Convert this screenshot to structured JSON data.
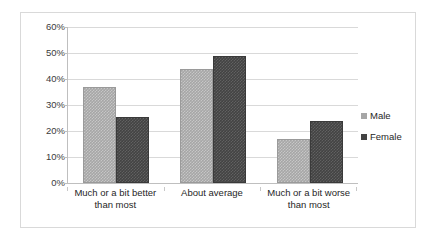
{
  "chart_data": {
    "type": "bar",
    "title": "",
    "subtitle": "",
    "xlabel": "",
    "ylabel": "",
    "ylim": [
      0,
      60
    ],
    "ytick_labels": [
      "0%",
      "10%",
      "20%",
      "30%",
      "40%",
      "50%",
      "60%"
    ],
    "ytick_values": [
      0,
      10,
      20,
      30,
      40,
      50,
      60
    ],
    "grid": true,
    "legend_position": "right",
    "categories": [
      "Much or a bit better than most",
      "About average",
      "Much or a bit worse than most"
    ],
    "category_lines": [
      [
        "Much or a bit better",
        "than most"
      ],
      [
        "About average",
        ""
      ],
      [
        "Much or a bit worse",
        "than most"
      ]
    ],
    "series": [
      {
        "name": "Male",
        "color": "#a6a6a6",
        "values": [
          37,
          44,
          17
        ]
      },
      {
        "name": "Female",
        "color": "#434343",
        "values": [
          25.5,
          49,
          24
        ]
      }
    ]
  },
  "legend": {
    "items": [
      {
        "label": "Male",
        "marker": "square-marker-light"
      },
      {
        "label": "Female",
        "marker": "square-marker-dark"
      }
    ]
  },
  "colors": {
    "male": "#a6a6a6",
    "female": "#434343",
    "gridline": "#d9d9d9",
    "axis": "#bfbfbf",
    "frame": "#d9d9d9",
    "text": "#262626"
  }
}
